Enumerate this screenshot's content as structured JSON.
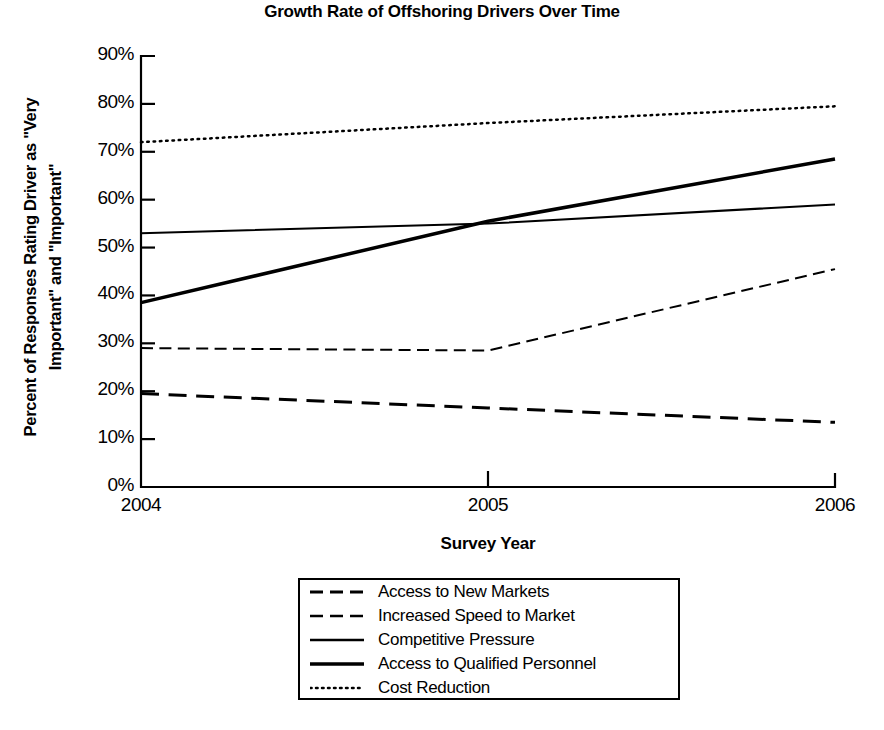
{
  "chart_data": {
    "type": "line",
    "title": "Growth Rate of Offshoring Drivers Over Time",
    "xlabel": "Survey Year",
    "ylabel": "Percent of Responses Rating Driver as \"Very Important\" and \"Important\"",
    "ylabel_line1": "Percent of Responses Rating Driver as \"Very",
    "ylabel_line2": "Important\" and \"Important\"",
    "categories": [
      "2004",
      "2005",
      "2006"
    ],
    "x": [
      2004,
      2005,
      2006
    ],
    "ylim": [
      0,
      90
    ],
    "xlim": [
      2004,
      2006
    ],
    "grid": false,
    "legend_position": "bottom-center",
    "ytick_labels": [
      "90%",
      "80%",
      "70%",
      "60%",
      "50%",
      "40%",
      "30%",
      "20%",
      "10%",
      "0%"
    ],
    "ytick_values": [
      90,
      80,
      70,
      60,
      50,
      40,
      30,
      20,
      10,
      0
    ],
    "xtick_labels": [
      "2004",
      "2005",
      "2006"
    ],
    "series": [
      {
        "name": "Access to New Markets",
        "values": [
          19.5,
          16.5,
          13.5
        ],
        "style": "dashed",
        "width": 3,
        "color": "#000000"
      },
      {
        "name": "Increased Speed to Market",
        "values": [
          29.0,
          28.5,
          45.5
        ],
        "style": "dashed",
        "width": 2,
        "color": "#000000"
      },
      {
        "name": "Competitive Pressure",
        "values": [
          53.0,
          55.0,
          59.0
        ],
        "style": "solid",
        "width": 2,
        "color": "#000000"
      },
      {
        "name": "Access to Qualified Personnel",
        "values": [
          38.5,
          55.5,
          68.5
        ],
        "style": "solid",
        "width": 3.5,
        "color": "#000000"
      },
      {
        "name": "Cost Reduction",
        "values": [
          72.0,
          76.0,
          79.5
        ],
        "style": "dotted",
        "width": 2.5,
        "color": "#000000"
      }
    ]
  },
  "legend": {
    "items": [
      {
        "label": "Access to New Markets",
        "style": "dashed",
        "width": 3
      },
      {
        "label": "Increased Speed to Market",
        "style": "dashed",
        "width": 2.5
      },
      {
        "label": "Competitive Pressure",
        "style": "solid",
        "width": 2.5
      },
      {
        "label": "Access to Qualified Personnel",
        "style": "solid",
        "width": 3.5
      },
      {
        "label": "Cost Reduction",
        "style": "dotted",
        "width": 2.5
      }
    ]
  },
  "colors": {
    "axis": "#000000",
    "line": "#000000",
    "background": "#ffffff"
  }
}
